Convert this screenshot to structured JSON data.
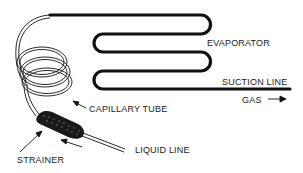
{
  "diagram": {
    "labels": {
      "evaporator": "EVAPORATOR",
      "suction_line": "SUCTION LINE",
      "gas": "GAS",
      "capillary_tube": "CAPILLARY TUBE",
      "liquid_line": "LIQUID LINE",
      "strainer": "STRAINER"
    },
    "components": [
      "evaporator",
      "suction-line",
      "capillary-tube",
      "strainer",
      "liquid-line"
    ],
    "flow_arrows": [
      {
        "near": "gas",
        "direction": "right"
      },
      {
        "near": "liquid-line",
        "direction": "up-left"
      }
    ],
    "colors": {
      "line": "#111111",
      "background": "#ffffff"
    }
  }
}
